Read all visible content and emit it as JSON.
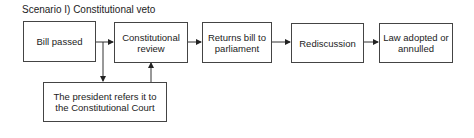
{
  "title": "Scenario I) Constitutional veto",
  "nodes": [
    {
      "id": "bill-passed",
      "label": "Bill passed"
    },
    {
      "id": "constitutional-review",
      "label": "Constitutional review"
    },
    {
      "id": "returns-bill",
      "label": "Returns bill to parliament"
    },
    {
      "id": "rediscussion",
      "label": "Rediscussion"
    },
    {
      "id": "law-adopted",
      "label": "Law adopted or annulled"
    },
    {
      "id": "president-refers",
      "label": "The president refers it to the Constitutional Court"
    }
  ],
  "edges": [
    {
      "from": "bill-passed",
      "to": "constitutional-review"
    },
    {
      "from": "bill-passed",
      "to": "president-refers"
    },
    {
      "from": "president-refers",
      "to": "constitutional-review"
    },
    {
      "from": "constitutional-review",
      "to": "returns-bill"
    },
    {
      "from": "returns-bill",
      "to": "rediscussion"
    },
    {
      "from": "rediscussion",
      "to": "law-adopted"
    }
  ]
}
